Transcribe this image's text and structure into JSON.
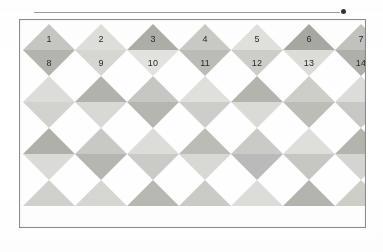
{
  "figure": {
    "arrow": {
      "name": "horizontal-arrow",
      "direction": "right"
    },
    "frame": {
      "border_color": "#8c8c8c",
      "background": "#fefefe"
    },
    "label_color": "#2a2a2a",
    "grid": {
      "columns": 7,
      "rows": 4,
      "cell_width": 52,
      "cell_height": 26
    },
    "labels": {
      "upper_row": [
        "1",
        "2",
        "3",
        "4",
        "5",
        "6",
        "7"
      ],
      "lower_row": [
        "8",
        "9",
        "10",
        "11",
        "12",
        "13",
        "14"
      ]
    },
    "palette": {
      "light": "#dcdcd8",
      "light2": "#d2d2ce",
      "mid": "#c4c4c0",
      "mid2": "#b9b9b4",
      "dark": "#ababa6",
      "dark2": "#9e9e99",
      "pale": "#e6e6e2"
    }
  },
  "chart_data": {
    "type": "heatmap",
    "title": "",
    "columns": 7,
    "rows": 4,
    "legend": [],
    "grid": false,
    "cells": [
      {
        "row": 1,
        "col": 1,
        "upper": "#c6c6c2",
        "lower": "#b4b4af",
        "upper_label": "1",
        "lower_label": "8"
      },
      {
        "row": 1,
        "col": 2,
        "upper": "#dedeDA",
        "lower": "#d6d6d2",
        "upper_label": "2",
        "lower_label": "9"
      },
      {
        "row": 1,
        "col": 3,
        "upper": "#aeaea9",
        "lower": "#e2e2de",
        "upper_label": "3",
        "lower_label": "10"
      },
      {
        "row": 1,
        "col": 4,
        "upper": "#c9c9c5",
        "lower": "#bcbcb7",
        "upper_label": "4",
        "lower_label": "11"
      },
      {
        "row": 1,
        "col": 5,
        "upper": "#e0e0dc",
        "lower": "#cdcdc9",
        "upper_label": "5",
        "lower_label": "12"
      },
      {
        "row": 1,
        "col": 6,
        "upper": "#a8a8a3",
        "lower": "#dcdcd8",
        "upper_label": "6",
        "lower_label": "13"
      },
      {
        "row": 1,
        "col": 7,
        "upper": "#c2c2be",
        "lower": "#b0b0ab",
        "upper_label": "7",
        "lower_label": "14"
      },
      {
        "row": 2,
        "col": 1,
        "upper": "#dcdcd8",
        "lower": "#d2d2ce",
        "upper_label": "",
        "lower_label": ""
      },
      {
        "row": 2,
        "col": 2,
        "upper": "#b2b2ad",
        "lower": "#d8d8d4",
        "upper_label": "",
        "lower_label": ""
      },
      {
        "row": 2,
        "col": 3,
        "upper": "#c6c6c2",
        "lower": "#b6b6b1",
        "upper_label": "",
        "lower_label": ""
      },
      {
        "row": 2,
        "col": 4,
        "upper": "#dfdfdb",
        "lower": "#cdcdc9",
        "upper_label": "",
        "lower_label": ""
      },
      {
        "row": 2,
        "col": 5,
        "upper": "#b4b4af",
        "lower": "#dadad6",
        "upper_label": "",
        "lower_label": ""
      },
      {
        "row": 2,
        "col": 6,
        "upper": "#cecec9",
        "lower": "#bdbdb8",
        "upper_label": "",
        "lower_label": ""
      },
      {
        "row": 2,
        "col": 7,
        "upper": "#dcdcd8",
        "lower": "#c8c8c4",
        "upper_label": "",
        "lower_label": ""
      },
      {
        "row": 3,
        "col": 1,
        "upper": "#b0b0ab",
        "lower": "#dadad6",
        "upper_label": "",
        "lower_label": ""
      },
      {
        "row": 3,
        "col": 2,
        "upper": "#c8c8c4",
        "lower": "#b6b6b1",
        "upper_label": "",
        "lower_label": ""
      },
      {
        "row": 3,
        "col": 3,
        "upper": "#dcdcd8",
        "lower": "#cacac6",
        "upper_label": "",
        "lower_label": ""
      },
      {
        "row": 3,
        "col": 4,
        "upper": "#bcbcb7",
        "lower": "#d8d8d4",
        "upper_label": "",
        "lower_label": ""
      },
      {
        "row": 3,
        "col": 5,
        "upper": "#cacac6",
        "lower": "#bababa",
        "upper_label": "",
        "lower_label": ""
      },
      {
        "row": 3,
        "col": 6,
        "upper": "#dedeDA",
        "lower": "#c6c6c2",
        "upper_label": "",
        "lower_label": ""
      },
      {
        "row": 3,
        "col": 7,
        "upper": "#b4b4af",
        "lower": "#d4d4d0",
        "upper_label": "",
        "lower_label": ""
      },
      {
        "row": 4,
        "col": 1,
        "upper": "#d0d0cc",
        "lower": "",
        "upper_label": "",
        "lower_label": ""
      },
      {
        "row": 4,
        "col": 2,
        "upper": "#d6d6d2",
        "lower": "",
        "upper_label": "",
        "lower_label": ""
      },
      {
        "row": 4,
        "col": 3,
        "upper": "#b8b8b3",
        "lower": "",
        "upper_label": "",
        "lower_label": ""
      },
      {
        "row": 4,
        "col": 4,
        "upper": "#cacac6",
        "lower": "",
        "upper_label": "",
        "lower_label": ""
      },
      {
        "row": 4,
        "col": 5,
        "upper": "#dcdcd8",
        "lower": "",
        "upper_label": "",
        "lower_label": ""
      },
      {
        "row": 4,
        "col": 6,
        "upper": "#b4b4af",
        "lower": "",
        "upper_label": "",
        "lower_label": ""
      },
      {
        "row": 4,
        "col": 7,
        "upper": "#cecec9",
        "lower": "",
        "upper_label": "",
        "lower_label": ""
      }
    ]
  }
}
